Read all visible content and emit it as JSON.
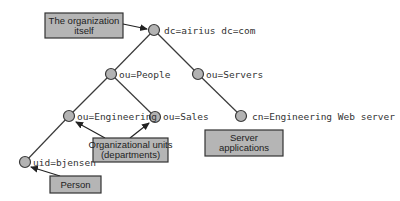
{
  "diagram": {
    "type": "LDAP directory information tree",
    "nodes": [
      {
        "id": "root",
        "label": "dc=airius dc=com",
        "x": 154,
        "y": 30
      },
      {
        "id": "people",
        "label": "ou=People",
        "x": 111,
        "y": 74
      },
      {
        "id": "servers",
        "label": "ou=Servers",
        "x": 198,
        "y": 74
      },
      {
        "id": "engineering",
        "label": "ou=Engineering",
        "x": 69,
        "y": 116
      },
      {
        "id": "sales",
        "label": "ou=Sales",
        "x": 155,
        "y": 117
      },
      {
        "id": "webserver",
        "label": "cn=Engineering Web server",
        "x": 241,
        "y": 116
      },
      {
        "id": "bjensen",
        "label": "uid=bjensen",
        "x": 25,
        "y": 162
      }
    ],
    "edges": [
      {
        "from": "root",
        "to": "people"
      },
      {
        "from": "root",
        "to": "servers"
      },
      {
        "from": "people",
        "to": "engineering"
      },
      {
        "from": "people",
        "to": "sales"
      },
      {
        "from": "servers",
        "to": "webserver"
      },
      {
        "from": "engineering",
        "to": "bjensen"
      }
    ],
    "callouts": [
      {
        "id": "organization",
        "lines": [
          "The organization",
          "itself"
        ],
        "points_to": [
          "root"
        ]
      },
      {
        "id": "org-units",
        "lines": [
          "Organizational units",
          "(departments)"
        ],
        "points_to": [
          "engineering",
          "sales"
        ]
      },
      {
        "id": "server-apps",
        "lines": [
          "Server",
          "applications"
        ],
        "points_to": []
      },
      {
        "id": "person",
        "lines": [
          "Person"
        ],
        "points_to": [
          "bjensen"
        ]
      }
    ]
  },
  "labels": {
    "root": "dc=airius dc=com",
    "people": "ou=People",
    "servers": "ou=Servers",
    "engineering": "ou=Engineering",
    "sales": "ou=Sales",
    "webserver": "cn=Engineering Web server",
    "bjensen": "uid=bjensen"
  },
  "callout_text": {
    "organization_1": "The organization",
    "organization_2": "itself",
    "orgunits_1": "Organizational units",
    "orgunits_2": "(departments)",
    "serverapps_1": "Server",
    "serverapps_2": "applications",
    "person_1": "Person"
  },
  "colors": {
    "node_fill": "#b3b3b3",
    "box_fill": "#b5b5b5",
    "line": "#3a3a3a",
    "background": "#ffffff"
  }
}
